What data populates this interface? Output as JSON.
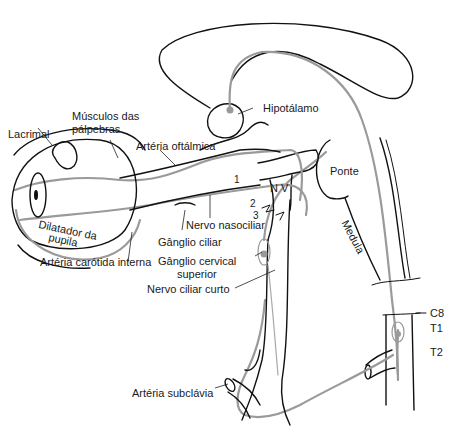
{
  "diagram": {
    "type": "anatomical illustration",
    "colors": {
      "outline": "#111111",
      "nerve_pathway": "#9a9a9a",
      "background": "#ffffff"
    },
    "labels": {
      "lacrimal": "Lacrimal",
      "musculos_line1": "Músculos das",
      "musculos_line2": "pálpebras",
      "arteria_oftalmica": "Artéria oftálmica",
      "hipotalamo": "Hipotálamo",
      "ponte": "Ponte",
      "medula": "Medula",
      "nv": "N V",
      "n1": "1",
      "n2": "2",
      "n3": "3",
      "nervo_nasociliar": "Nervo nasociliar",
      "ganglio_ciliar": "Gânglio ciliar",
      "dilatador_line1": "Dilatador da",
      "dilatador_line2": "pupila",
      "arteria_carotida": "Artéria carótida interna",
      "ganglio_cervical_line1": "Gânglio cervical",
      "ganglio_cervical_line2": "superior",
      "nervo_ciliar_curto": "Nervo ciliar curto",
      "c8": "C8",
      "t1": "T1",
      "t2": "T2",
      "arteria_subclavia": "Artéria subclávia"
    }
  }
}
